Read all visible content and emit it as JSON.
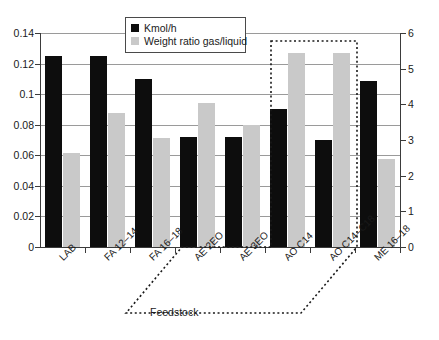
{
  "chart_data": {
    "type": "bar",
    "title": "",
    "xlabel": "Feedstock",
    "ylabel": "",
    "categories": [
      "LAB",
      "FA 12–14",
      "FA 16–18",
      "AE 2EO",
      "AE 3EO",
      "AO C14",
      "AO C14–C18",
      "ME 16–18"
    ],
    "series": [
      {
        "name": "Kmol/h",
        "axis": "left",
        "color": "#0d0d0d",
        "values": [
          0.125,
          0.125,
          0.11,
          0.072,
          0.072,
          0.09,
          0.07,
          0.1085
        ]
      },
      {
        "name": "Weight ratio gas/liquid",
        "axis": "right",
        "color": "#c9c9c9",
        "values": [
          2.64,
          3.75,
          3.07,
          4.05,
          3.41,
          5.45,
          5.45,
          2.46
        ]
      }
    ],
    "left_axis": {
      "min": 0,
      "max": 0.14,
      "step": 0.02,
      "ticks": [
        "0",
        "0.02",
        "0.04",
        "0.06",
        "0.08",
        "0.1",
        "0.12",
        "0.14"
      ]
    },
    "right_axis": {
      "min": 0,
      "max": 6,
      "step": 1,
      "ticks": [
        "0",
        "1",
        "2",
        "3",
        "4",
        "5",
        "6"
      ]
    },
    "grid": true,
    "legend_position": "top-center",
    "annotations": [
      {
        "name": "highlight-region",
        "style": "dotted-parallelogram",
        "covers": [
          "AO C14",
          "AO C14–C18"
        ],
        "color": "#1a1a1a"
      }
    ]
  },
  "legend": {
    "items": [
      {
        "label": "Kmol/h",
        "swatch": "black"
      },
      {
        "label": "Weight ratio gas/liquid",
        "swatch": "gray"
      }
    ]
  },
  "axis_title": {
    "x": "Feedstock"
  }
}
